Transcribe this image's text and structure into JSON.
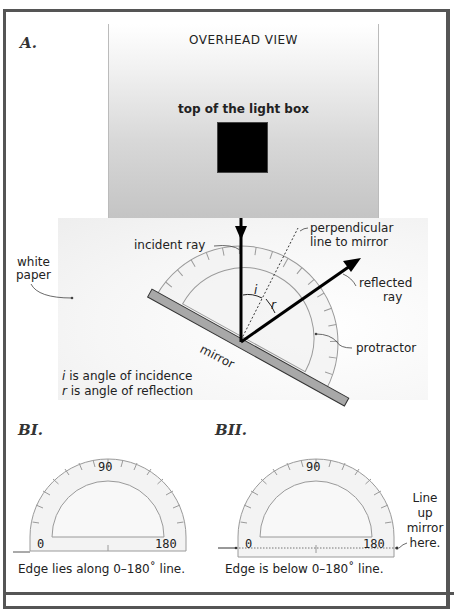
{
  "section_a": {
    "label": "A.",
    "overhead_title": "OVERHEAD VIEW",
    "lightbox_label": "top of the light box",
    "white_paper_label_line1": "white",
    "white_paper_label_line2": "paper",
    "incident_ray_label": "incident ray",
    "perpendicular_label_line1": "perpendicular",
    "perpendicular_label_line2": "line to mirror",
    "reflected_label_line1": "reflected",
    "reflected_label_line2": "ray",
    "protractor_label": "protractor",
    "mirror_label": "mirror",
    "angle_i_symbol": "i",
    "angle_r_symbol": "r",
    "legend_line1_symbol": "i",
    "legend_line1_text": " is angle of incidence",
    "legend_line2_symbol": "r",
    "legend_line2_text": " is angle of reflection"
  },
  "section_b1": {
    "label": "BI.",
    "tick_90": "90",
    "tick_0": "0",
    "tick_180": "180",
    "caption": "Edge lies along 0–180˚ line."
  },
  "section_b2": {
    "label": "BII.",
    "tick_90": "90",
    "tick_0": "0",
    "tick_180": "180",
    "side_note_line1": "Line",
    "side_note_line2": "up",
    "side_note_line3": "mirror",
    "side_note_line4": "here.",
    "caption": "Edge is below 0–180˚ line."
  },
  "colors": {
    "frame": "#555555",
    "mirror_fill": "#a8a8a8",
    "protractor_fill": "#f2f2f2",
    "protractor_stroke": "#9a9a9a",
    "ray": "#000000"
  }
}
